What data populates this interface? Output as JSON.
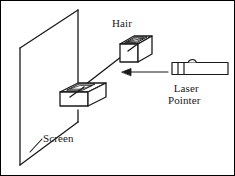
{
  "figure": {
    "type": "physics-apparatus-diagram",
    "background_color": "#ffffff",
    "stroke_color": "#1a1a1a",
    "border_color": "#000000",
    "width": 235,
    "height": 176
  },
  "labels": {
    "hair": "Hair",
    "laser_line_1": "Laser",
    "laser_line_2": "Pointer",
    "screen": "Screen"
  },
  "components": [
    {
      "name": "screen",
      "shape": "parallelogram-outline",
      "label": "Screen",
      "corners": [
        [
          20,
          48
        ],
        [
          78,
          10
        ],
        [
          78,
          122
        ],
        [
          20,
          165
        ]
      ]
    },
    {
      "name": "hair-holder-block",
      "shape": "3d-box-with-slot",
      "position": [
        60,
        83
      ]
    },
    {
      "name": "hair-block",
      "shape": "3d-box-with-slot",
      "label": "Hair",
      "position": [
        120,
        36
      ]
    },
    {
      "name": "laser-beam",
      "shape": "line",
      "from": [
        138,
        44
      ],
      "to": [
        70,
        97
      ]
    },
    {
      "name": "beam-direction-arrow",
      "shape": "arrow-left",
      "from": [
        170,
        72
      ],
      "to": [
        124,
        72
      ]
    },
    {
      "name": "laser-pointer",
      "shape": "rectangle-with-button",
      "label": "Laser Pointer",
      "bounds": [
        170,
        62,
        58,
        13
      ]
    },
    {
      "name": "screen-leader-line",
      "shape": "polyline",
      "points": [
        [
          34,
          148
        ],
        [
          42,
          140
        ]
      ]
    }
  ]
}
